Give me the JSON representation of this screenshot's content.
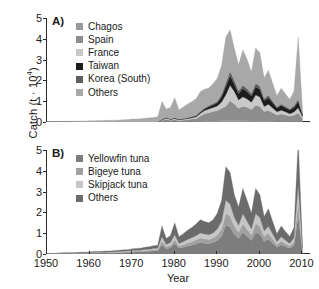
{
  "figure": {
    "y_axis_label": "Catch (t · 10",
    "y_axis_exponent": "4",
    "y_axis_label_tail": ")",
    "x_axis_label": "Year"
  },
  "chart_data": [
    {
      "type": "area",
      "panel": "A)",
      "title": "",
      "xlabel": "Year",
      "ylabel": "Catch (t · 10^4)",
      "xlim": [
        1950,
        2012
      ],
      "ylim": [
        0,
        5
      ],
      "xticks": [
        1950,
        1960,
        1970,
        1980,
        1990,
        2000,
        2010
      ],
      "yticks": [
        0,
        1,
        2,
        3,
        4,
        5
      ],
      "grid": false,
      "stacked": true,
      "legend_position": "top-left",
      "legend": [
        "Chagos",
        "Spain",
        "France",
        "Taiwan",
        "Korea (South)",
        "Others"
      ],
      "colors": {
        "Chagos": "#9a9a9a",
        "Spain": "#8d8d8d",
        "France": "#c8c8c8",
        "Taiwan": "#1c1c1c",
        "Korea (South)": "#5e5e5e",
        "Others": "#a8a8a8"
      },
      "x": [
        1950,
        1951,
        1952,
        1953,
        1954,
        1955,
        1956,
        1957,
        1958,
        1959,
        1960,
        1961,
        1962,
        1963,
        1964,
        1965,
        1966,
        1967,
        1968,
        1969,
        1970,
        1971,
        1972,
        1973,
        1974,
        1975,
        1976,
        1977,
        1978,
        1979,
        1980,
        1981,
        1982,
        1983,
        1984,
        1985,
        1986,
        1987,
        1988,
        1989,
        1990,
        1991,
        1992,
        1993,
        1994,
        1995,
        1996,
        1997,
        1998,
        1999,
        2000,
        2001,
        2002,
        2003,
        2004,
        2005,
        2006,
        2007,
        2008,
        2009,
        2010
      ],
      "series": [
        {
          "name": "Chagos",
          "values": [
            0,
            0,
            0,
            0,
            0,
            0,
            0,
            0,
            0,
            0,
            0,
            0,
            0,
            0,
            0,
            0,
            0,
            0,
            0,
            0,
            0,
            0,
            0,
            0,
            0,
            0,
            0,
            0.02,
            0.03,
            0.02,
            0.03,
            0.02,
            0.03,
            0.03,
            0.04,
            0.04,
            0.04,
            0.05,
            0.05,
            0.05,
            0.05,
            0.06,
            0.06,
            0.07,
            0.07,
            0.06,
            0.06,
            0.06,
            0.05,
            0.05,
            0.05,
            0.05,
            0.05,
            0.05,
            0.04,
            0.04,
            0.04,
            0.03,
            0.03,
            0.03,
            0.02
          ]
        },
        {
          "name": "Spain",
          "values": [
            0,
            0,
            0,
            0,
            0,
            0,
            0,
            0,
            0,
            0,
            0,
            0,
            0,
            0,
            0,
            0,
            0,
            0,
            0,
            0,
            0,
            0,
            0,
            0,
            0,
            0,
            0,
            0.05,
            0.1,
            0.06,
            0.08,
            0.05,
            0.06,
            0.08,
            0.1,
            0.12,
            0.25,
            0.35,
            0.4,
            0.45,
            0.5,
            0.6,
            0.7,
            0.95,
            0.8,
            0.6,
            0.7,
            0.65,
            0.55,
            0.75,
            0.7,
            0.45,
            0.5,
            0.4,
            0.3,
            0.35,
            0.3,
            0.25,
            0.3,
            0.4,
            0.15
          ]
        },
        {
          "name": "France",
          "values": [
            0,
            0,
            0,
            0,
            0,
            0,
            0,
            0,
            0,
            0,
            0,
            0,
            0,
            0,
            0,
            0,
            0,
            0,
            0,
            0,
            0,
            0,
            0,
            0,
            0,
            0,
            0,
            0.03,
            0.05,
            0.04,
            0.05,
            0.04,
            0.04,
            0.05,
            0.06,
            0.08,
            0.12,
            0.15,
            0.18,
            0.2,
            0.22,
            0.3,
            0.55,
            0.75,
            0.6,
            0.4,
            0.45,
            0.4,
            0.35,
            0.5,
            0.45,
            0.25,
            0.3,
            0.22,
            0.15,
            0.18,
            0.15,
            0.12,
            0.15,
            0.25,
            0.08
          ]
        },
        {
          "name": "Taiwan",
          "values": [
            0,
            0,
            0,
            0,
            0,
            0,
            0,
            0,
            0,
            0,
            0,
            0,
            0,
            0,
            0,
            0,
            0,
            0,
            0,
            0,
            0,
            0,
            0,
            0,
            0,
            0,
            0,
            0.02,
            0.03,
            0.02,
            0.03,
            0.02,
            0.02,
            0.03,
            0.04,
            0.05,
            0.06,
            0.08,
            0.1,
            0.12,
            0.15,
            0.25,
            0.4,
            0.45,
            0.35,
            0.3,
            0.4,
            0.35,
            0.3,
            0.4,
            0.38,
            0.28,
            0.32,
            0.25,
            0.18,
            0.22,
            0.2,
            0.18,
            0.22,
            0.3,
            0.1
          ]
        },
        {
          "name": "Korea (South)",
          "values": [
            0,
            0,
            0,
            0,
            0,
            0,
            0,
            0,
            0,
            0,
            0,
            0,
            0,
            0,
            0,
            0,
            0,
            0,
            0,
            0,
            0,
            0,
            0,
            0,
            0,
            0,
            0,
            0.01,
            0.02,
            0.01,
            0.02,
            0.01,
            0.02,
            0.02,
            0.03,
            0.03,
            0.04,
            0.05,
            0.06,
            0.07,
            0.08,
            0.12,
            0.18,
            0.22,
            0.18,
            0.14,
            0.16,
            0.14,
            0.12,
            0.16,
            0.15,
            0.1,
            0.12,
            0.09,
            0.06,
            0.08,
            0.07,
            0.06,
            0.08,
            0.12,
            0.04
          ]
        },
        {
          "name": "Others",
          "values": [
            0.02,
            0.02,
            0.02,
            0.03,
            0.03,
            0.03,
            0.04,
            0.04,
            0.05,
            0.05,
            0.06,
            0.06,
            0.07,
            0.07,
            0.08,
            0.08,
            0.09,
            0.1,
            0.11,
            0.12,
            0.14,
            0.15,
            0.16,
            0.18,
            0.2,
            0.22,
            0.25,
            0.85,
            0.4,
            0.55,
            0.95,
            0.45,
            0.55,
            0.65,
            0.7,
            0.8,
            0.95,
            0.9,
            0.85,
            0.95,
            1.1,
            1.4,
            2.2,
            2.0,
            1.55,
            1.25,
            1.7,
            1.4,
            1.05,
            1.7,
            1.6,
            1.0,
            1.2,
            0.85,
            0.55,
            0.75,
            0.6,
            0.45,
            0.7,
            3.0,
            0.25
          ]
        }
      ]
    },
    {
      "type": "area",
      "panel": "B)",
      "title": "",
      "xlabel": "Year",
      "ylabel": "Catch (t · 10^4)",
      "xlim": [
        1950,
        2012
      ],
      "ylim": [
        0,
        5
      ],
      "xticks": [
        1950,
        1960,
        1970,
        1980,
        1990,
        2000,
        2010
      ],
      "yticks": [
        0,
        1,
        2,
        3,
        4,
        5
      ],
      "grid": false,
      "stacked": true,
      "legend_position": "top-left",
      "legend": [
        "Yellowfin tuna",
        "Bigeye tuna",
        "Skipjack tuna",
        "Others"
      ],
      "colors": {
        "Yellowfin tuna": "#7d7d7d",
        "Bigeye tuna": "#a0a0a0",
        "Skipjack tuna": "#c6c6c6",
        "Others": "#6b6b6b"
      },
      "x": [
        1950,
        1951,
        1952,
        1953,
        1954,
        1955,
        1956,
        1957,
        1958,
        1959,
        1960,
        1961,
        1962,
        1963,
        1964,
        1965,
        1966,
        1967,
        1968,
        1969,
        1970,
        1971,
        1972,
        1973,
        1974,
        1975,
        1976,
        1977,
        1978,
        1979,
        1980,
        1981,
        1982,
        1983,
        1984,
        1985,
        1986,
        1987,
        1988,
        1989,
        1990,
        1991,
        1992,
        1993,
        1994,
        1995,
        1996,
        1997,
        1998,
        1999,
        2000,
        2001,
        2002,
        2003,
        2004,
        2005,
        2006,
        2007,
        2008,
        2009,
        2010
      ],
      "series": [
        {
          "name": "Yellowfin tuna",
          "values": [
            0.01,
            0.01,
            0.01,
            0.02,
            0.02,
            0.02,
            0.02,
            0.03,
            0.03,
            0.03,
            0.04,
            0.04,
            0.04,
            0.05,
            0.05,
            0.05,
            0.06,
            0.06,
            0.07,
            0.08,
            0.09,
            0.1,
            0.1,
            0.12,
            0.13,
            0.15,
            0.16,
            0.45,
            0.25,
            0.3,
            0.5,
            0.28,
            0.32,
            0.38,
            0.42,
            0.48,
            0.55,
            0.52,
            0.5,
            0.55,
            0.65,
            0.85,
            1.4,
            1.3,
            0.95,
            0.75,
            1.05,
            0.85,
            0.65,
            1.05,
            0.95,
            0.6,
            0.72,
            0.52,
            0.32,
            0.45,
            0.36,
            0.28,
            0.42,
            1.8,
            0.15
          ]
        },
        {
          "name": "Bigeye tuna",
          "values": [
            0.005,
            0.005,
            0.005,
            0.01,
            0.01,
            0.01,
            0.01,
            0.01,
            0.01,
            0.015,
            0.015,
            0.02,
            0.02,
            0.02,
            0.02,
            0.025,
            0.025,
            0.03,
            0.03,
            0.03,
            0.04,
            0.04,
            0.04,
            0.05,
            0.05,
            0.06,
            0.06,
            0.18,
            0.1,
            0.12,
            0.2,
            0.11,
            0.13,
            0.15,
            0.17,
            0.19,
            0.22,
            0.21,
            0.2,
            0.22,
            0.26,
            0.34,
            0.56,
            0.52,
            0.38,
            0.3,
            0.42,
            0.34,
            0.26,
            0.42,
            0.38,
            0.24,
            0.29,
            0.21,
            0.13,
            0.18,
            0.14,
            0.11,
            0.17,
            0.72,
            0.06
          ]
        },
        {
          "name": "Skipjack tuna",
          "values": [
            0.005,
            0.005,
            0.005,
            0.01,
            0.01,
            0.01,
            0.01,
            0.01,
            0.01,
            0.015,
            0.015,
            0.02,
            0.02,
            0.02,
            0.02,
            0.025,
            0.025,
            0.03,
            0.03,
            0.03,
            0.04,
            0.04,
            0.04,
            0.05,
            0.05,
            0.06,
            0.06,
            0.2,
            0.11,
            0.13,
            0.22,
            0.12,
            0.14,
            0.17,
            0.19,
            0.21,
            0.24,
            0.23,
            0.22,
            0.24,
            0.29,
            0.38,
            0.62,
            0.58,
            0.42,
            0.33,
            0.46,
            0.38,
            0.29,
            0.46,
            0.42,
            0.26,
            0.32,
            0.23,
            0.14,
            0.2,
            0.16,
            0.12,
            0.19,
            0.8,
            0.07
          ]
        },
        {
          "name": "Others",
          "values": [
            0.01,
            0.01,
            0.01,
            0.01,
            0.02,
            0.02,
            0.02,
            0.02,
            0.03,
            0.03,
            0.03,
            0.04,
            0.04,
            0.04,
            0.05,
            0.05,
            0.06,
            0.06,
            0.07,
            0.07,
            0.08,
            0.09,
            0.1,
            0.11,
            0.12,
            0.13,
            0.14,
            0.52,
            0.28,
            0.34,
            0.58,
            0.32,
            0.38,
            0.44,
            0.5,
            0.56,
            0.64,
            0.6,
            0.58,
            0.64,
            0.76,
            1.0,
            1.62,
            1.52,
            1.1,
            0.88,
            1.22,
            1.0,
            0.76,
            1.22,
            1.1,
            0.7,
            0.84,
            0.6,
            0.38,
            0.52,
            0.42,
            0.33,
            0.49,
            2.1,
            0.18
          ]
        }
      ]
    }
  ]
}
